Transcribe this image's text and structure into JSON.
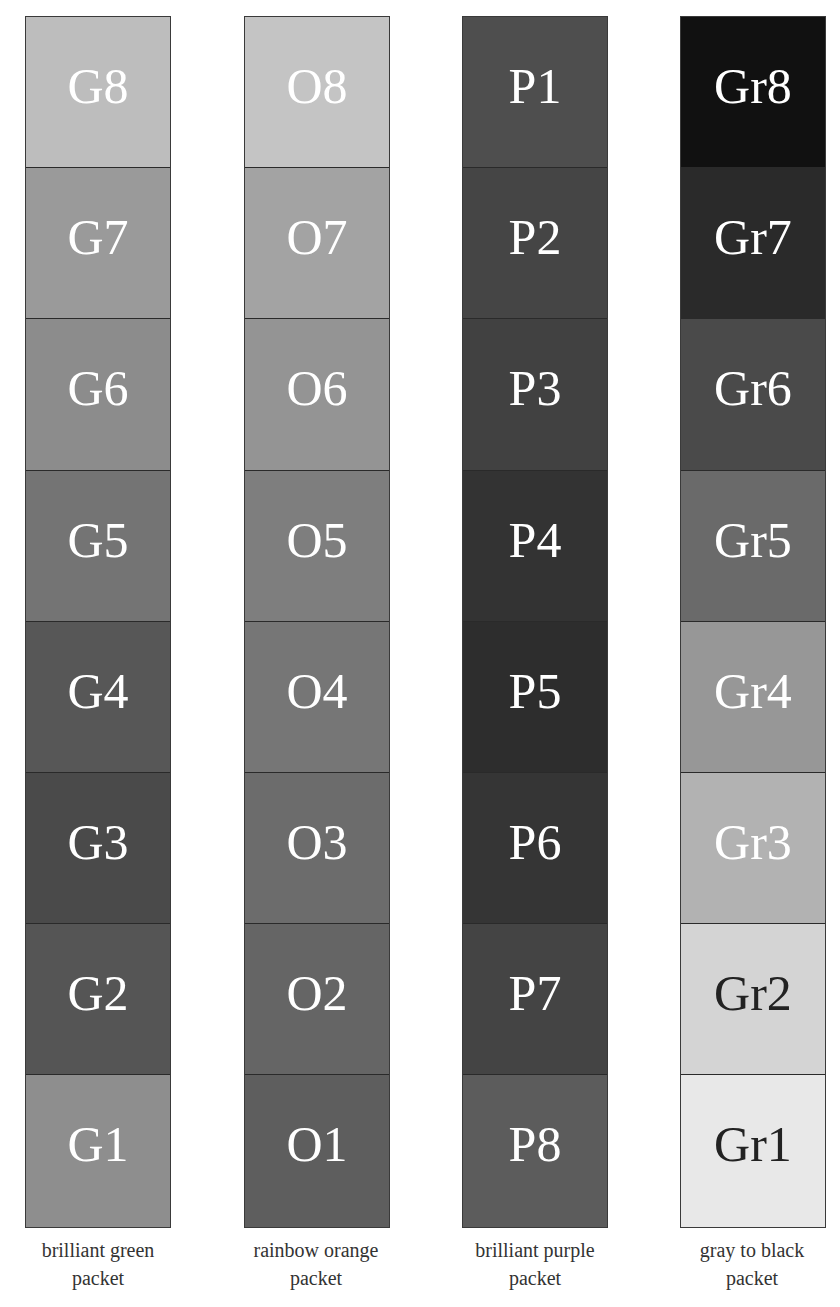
{
  "packets": [
    {
      "name": "brilliant green",
      "caption_line1": "brilliant green",
      "caption_line2": "packet",
      "swatches": [
        {
          "label": "G8",
          "color": "#bdbdbd",
          "text_color": "#ffffff"
        },
        {
          "label": "G7",
          "color": "#9a9a9a",
          "text_color": "#ffffff"
        },
        {
          "label": "G6",
          "color": "#8c8c8c",
          "text_color": "#ffffff"
        },
        {
          "label": "G5",
          "color": "#747474",
          "text_color": "#ffffff"
        },
        {
          "label": "G4",
          "color": "#575757",
          "text_color": "#ffffff"
        },
        {
          "label": "G3",
          "color": "#4a4a4a",
          "text_color": "#ffffff"
        },
        {
          "label": "G2",
          "color": "#555555",
          "text_color": "#ffffff"
        },
        {
          "label": "G1",
          "color": "#8e8e8e",
          "text_color": "#ffffff"
        }
      ]
    },
    {
      "name": "rainbow orange",
      "caption_line1": "rainbow orange",
      "caption_line2": "packet",
      "swatches": [
        {
          "label": "O8",
          "color": "#c4c4c4",
          "text_color": "#ffffff"
        },
        {
          "label": "O7",
          "color": "#a3a3a3",
          "text_color": "#ffffff"
        },
        {
          "label": "O6",
          "color": "#949494",
          "text_color": "#ffffff"
        },
        {
          "label": "O5",
          "color": "#7e7e7e",
          "text_color": "#ffffff"
        },
        {
          "label": "O4",
          "color": "#767676",
          "text_color": "#ffffff"
        },
        {
          "label": "O3",
          "color": "#6c6c6c",
          "text_color": "#ffffff"
        },
        {
          "label": "O2",
          "color": "#656565",
          "text_color": "#ffffff"
        },
        {
          "label": "O1",
          "color": "#5e5e5e",
          "text_color": "#ffffff"
        }
      ]
    },
    {
      "name": "brilliant purple",
      "caption_line1": "brilliant purple",
      "caption_line2": "packet",
      "swatches": [
        {
          "label": "P1",
          "color": "#4e4e4e",
          "text_color": "#ffffff"
        },
        {
          "label": "P2",
          "color": "#454545",
          "text_color": "#ffffff"
        },
        {
          "label": "P3",
          "color": "#414141",
          "text_color": "#ffffff"
        },
        {
          "label": "P4",
          "color": "#333333",
          "text_color": "#ffffff"
        },
        {
          "label": "P5",
          "color": "#2d2d2d",
          "text_color": "#ffffff"
        },
        {
          "label": "P6",
          "color": "#353535",
          "text_color": "#ffffff"
        },
        {
          "label": "P7",
          "color": "#444444",
          "text_color": "#ffffff"
        },
        {
          "label": "P8",
          "color": "#5c5c5c",
          "text_color": "#ffffff"
        }
      ]
    },
    {
      "name": "gray to black",
      "caption_line1": "gray to black",
      "caption_line2": "packet",
      "swatches": [
        {
          "label": "Gr8",
          "color": "#111111",
          "text_color": "#ffffff"
        },
        {
          "label": "Gr7",
          "color": "#2a2a2a",
          "text_color": "#ffffff"
        },
        {
          "label": "Gr6",
          "color": "#4a4a4a",
          "text_color": "#ffffff"
        },
        {
          "label": "Gr5",
          "color": "#6a6a6a",
          "text_color": "#ffffff"
        },
        {
          "label": "Gr4",
          "color": "#979797",
          "text_color": "#ffffff"
        },
        {
          "label": "Gr3",
          "color": "#b2b2b2",
          "text_color": "#ffffff"
        },
        {
          "label": "Gr2",
          "color": "#d4d4d4",
          "text_color": "#222222"
        },
        {
          "label": "Gr1",
          "color": "#e8e8e8",
          "text_color": "#222222"
        }
      ]
    }
  ]
}
